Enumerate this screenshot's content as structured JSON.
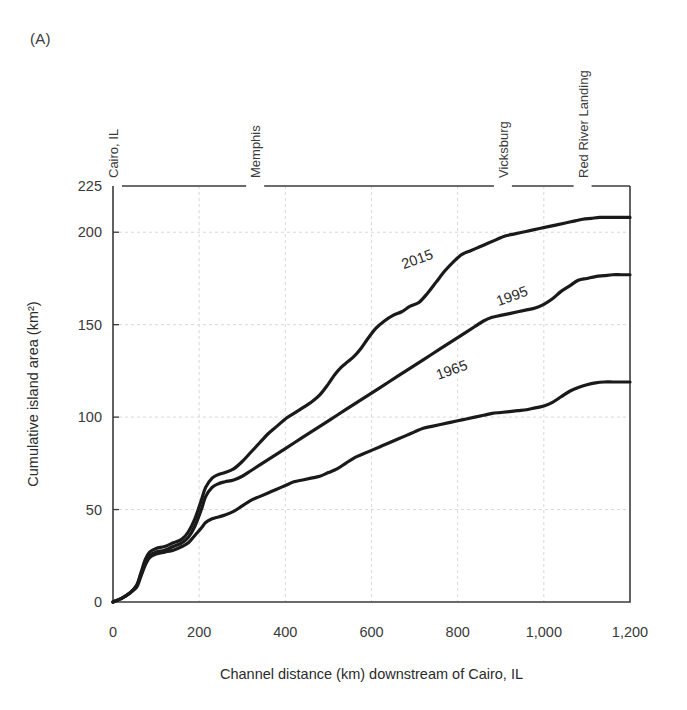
{
  "figure": {
    "panel_label": "(A)"
  },
  "chart_data": {
    "type": "line",
    "title": "",
    "xlabel": "Channel distance (km) downstream of Cairo, IL",
    "ylabel": "Cumulative island area (km²)",
    "ylabel_plain": "Cumulative island area (km2)",
    "xlim": [
      0,
      1200
    ],
    "ylim": [
      0,
      225
    ],
    "xticks": [
      0,
      200,
      400,
      600,
      800,
      1000,
      1200
    ],
    "xtick_labels": [
      "0",
      "200",
      "400",
      "600",
      "800",
      "1,000",
      "1,200"
    ],
    "yticks": [
      0,
      50,
      100,
      150,
      200,
      225
    ],
    "ytick_labels": [
      "0",
      "50",
      "100",
      "150",
      "200",
      "225"
    ],
    "grid": true,
    "grid_axis": "both",
    "legend_position": "inline-labels",
    "landmarks": [
      {
        "name": "Cairo, IL",
        "x": 0
      },
      {
        "name": "Memphis",
        "x": 330
      },
      {
        "name": "Vicksburg",
        "x": 905
      },
      {
        "name": "Red River Landing",
        "x": 1090
      }
    ],
    "series": [
      {
        "name": "2015",
        "label_x": 710,
        "label_y": 183,
        "x": [
          0,
          20,
          40,
          55,
          65,
          75,
          85,
          100,
          120,
          140,
          160,
          175,
          190,
          205,
          215,
          230,
          245,
          260,
          280,
          300,
          320,
          340,
          360,
          380,
          400,
          420,
          440,
          460,
          480,
          500,
          515,
          530,
          545,
          560,
          575,
          590,
          610,
          630,
          650,
          670,
          690,
          710,
          730,
          750,
          770,
          790,
          810,
          830,
          850,
          870,
          890,
          910,
          930,
          950,
          970,
          990,
          1010,
          1030,
          1050,
          1070,
          1090,
          1110,
          1130,
          1150,
          1175,
          1200
        ],
        "y": [
          0,
          2,
          5,
          9,
          16,
          23,
          27,
          29,
          30,
          32,
          34,
          38,
          45,
          55,
          62,
          67,
          69,
          70,
          72,
          76,
          81,
          86,
          91,
          95,
          99,
          102,
          105,
          108,
          112,
          118,
          123,
          127,
          130,
          133,
          137,
          142,
          148,
          152,
          155,
          157,
          160,
          162,
          167,
          173,
          179,
          184,
          188,
          190,
          192,
          194,
          196,
          198,
          199,
          200,
          201,
          202,
          203,
          204,
          205,
          206,
          207,
          207.5,
          208,
          208,
          208,
          208
        ]
      },
      {
        "name": "1995",
        "label_x": 930,
        "label_y": 163,
        "x": [
          0,
          20,
          40,
          55,
          65,
          75,
          85,
          100,
          120,
          140,
          160,
          175,
          190,
          205,
          215,
          230,
          245,
          260,
          280,
          300,
          320,
          340,
          360,
          380,
          400,
          420,
          440,
          460,
          480,
          500,
          520,
          540,
          560,
          580,
          600,
          620,
          640,
          660,
          680,
          700,
          720,
          740,
          760,
          780,
          800,
          820,
          840,
          860,
          880,
          900,
          920,
          940,
          960,
          980,
          1000,
          1020,
          1040,
          1060,
          1080,
          1100,
          1120,
          1140,
          1160,
          1180,
          1200
        ],
        "y": [
          0,
          2,
          5,
          9,
          15,
          21,
          25,
          27,
          28,
          30,
          32,
          35,
          41,
          50,
          57,
          62,
          64,
          65,
          66,
          68,
          71,
          74,
          77,
          80,
          83,
          86,
          89,
          92,
          95,
          98,
          101,
          104,
          107,
          110,
          113,
          116,
          119,
          122,
          125,
          128,
          131,
          134,
          137,
          140,
          143,
          146,
          149,
          152,
          154,
          155,
          156,
          157,
          158,
          159,
          161,
          164,
          168,
          171,
          174,
          175,
          176,
          176.5,
          177,
          177,
          177
        ]
      },
      {
        "name": "1965",
        "label_x": 790,
        "label_y": 123,
        "x": [
          0,
          20,
          40,
          55,
          65,
          75,
          85,
          100,
          120,
          140,
          160,
          175,
          190,
          205,
          215,
          230,
          245,
          260,
          280,
          300,
          320,
          340,
          360,
          380,
          400,
          420,
          440,
          460,
          480,
          500,
          520,
          540,
          560,
          580,
          600,
          620,
          640,
          660,
          680,
          700,
          720,
          740,
          760,
          780,
          800,
          820,
          840,
          860,
          880,
          900,
          920,
          940,
          960,
          980,
          1000,
          1020,
          1040,
          1060,
          1080,
          1100,
          1120,
          1140,
          1160,
          1180,
          1200
        ],
        "y": [
          0,
          2,
          5,
          8,
          14,
          20,
          24,
          26,
          27,
          28,
          30,
          32,
          36,
          40,
          43,
          45,
          46,
          47,
          49,
          52,
          55,
          57,
          59,
          61,
          63,
          65,
          66,
          67,
          68,
          70,
          72,
          75,
          78,
          80,
          82,
          84,
          86,
          88,
          90,
          92,
          94,
          95,
          96,
          97,
          98,
          99,
          100,
          101,
          102,
          102.5,
          103,
          103.5,
          104,
          105,
          106,
          108,
          111,
          114,
          116,
          117.5,
          118.5,
          119,
          119,
          119,
          119
        ]
      }
    ]
  }
}
